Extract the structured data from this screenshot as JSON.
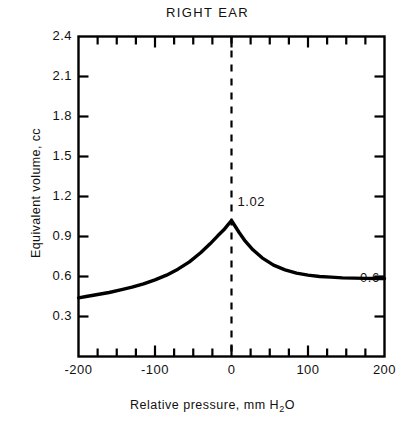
{
  "chart_data": {
    "type": "line",
    "title": "RIGHT EAR",
    "xlabel_text": "Relative pressure, mm H",
    "xlabel_sub": "2",
    "xlabel_tail": "O",
    "xlabel": "Relative pressure, mm H2O",
    "ylabel": "Equivalent volume, cc",
    "xlim": [
      -200,
      200
    ],
    "ylim": [
      0.0,
      2.4
    ],
    "grid": false,
    "legend": "none",
    "xticks": [
      -200,
      -100,
      0,
      100,
      200
    ],
    "xtick_labels": [
      "-200",
      "-100",
      "0",
      "100",
      "200"
    ],
    "yticks": [
      0.3,
      0.6,
      0.9,
      1.2,
      1.5,
      1.8,
      2.1,
      2.4
    ],
    "ytick_labels": [
      "0.3",
      "0.6",
      "0.9",
      "1.2",
      "1.5",
      "1.8",
      "2.1",
      "2.4"
    ],
    "minor_tick_interval": 25,
    "annotations": [
      {
        "name": "peak-value-label",
        "text": "1.02",
        "x": 0,
        "y": 1.02
      },
      {
        "name": "tail-value-label",
        "text": "0.6",
        "x": 160,
        "y": 0.45
      }
    ],
    "reference_line": {
      "name": "zero-pressure-line",
      "x": 0,
      "style": "dashed"
    },
    "series": [
      {
        "name": "right ear tympanogram",
        "x": [
          -200,
          -190,
          -175,
          -160,
          -145,
          -130,
          -115,
          -100,
          -85,
          -70,
          -55,
          -40,
          -28,
          -18,
          -10,
          -5,
          0,
          5,
          10,
          18,
          28,
          40,
          55,
          70,
          85,
          100,
          115,
          130,
          145,
          160,
          175,
          190,
          200
        ],
        "values": [
          0.44,
          0.45,
          0.465,
          0.48,
          0.5,
          0.52,
          0.545,
          0.575,
          0.61,
          0.655,
          0.71,
          0.78,
          0.845,
          0.905,
          0.95,
          0.985,
          1.02,
          0.975,
          0.93,
          0.865,
          0.8,
          0.74,
          0.685,
          0.65,
          0.625,
          0.61,
          0.6,
          0.595,
          0.59,
          0.588,
          0.586,
          0.585,
          0.585
        ]
      }
    ]
  }
}
